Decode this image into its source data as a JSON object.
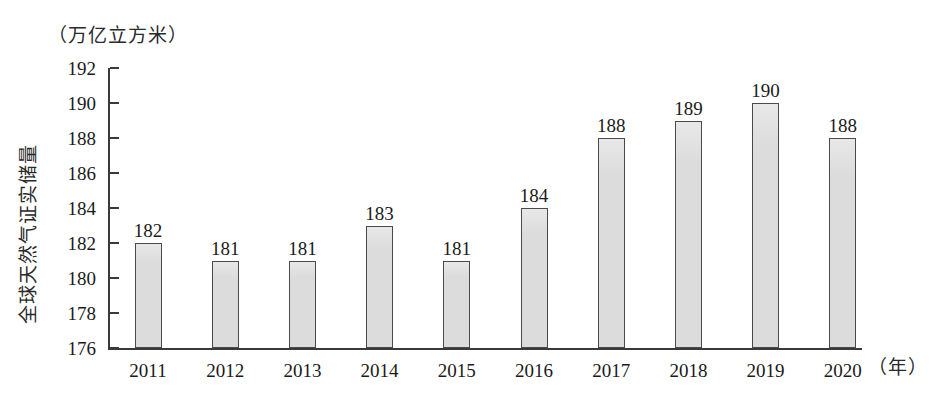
{
  "chart_data": {
    "type": "bar",
    "title": "",
    "subtitle": "",
    "xlabel": "（年）",
    "ylabel": "全球天然气证实储量",
    "unit_caption": "（万亿立方米）",
    "categories": [
      "2011",
      "2012",
      "2013",
      "2014",
      "2015",
      "2016",
      "2017",
      "2018",
      "2019",
      "2020"
    ],
    "values": [
      182,
      181,
      181,
      183,
      181,
      184,
      188,
      189,
      190,
      188
    ],
    "value_labels": [
      "182",
      "181",
      "181",
      "183",
      "181",
      "184",
      "188",
      "189",
      "190",
      "188"
    ],
    "ylim": [
      176,
      192
    ],
    "yticks": [
      176,
      178,
      180,
      182,
      184,
      186,
      188,
      190,
      192
    ],
    "ytick_labels": [
      "176",
      "178",
      "180",
      "182",
      "184",
      "186",
      "188",
      "190",
      "192"
    ],
    "grid": false,
    "legend": null,
    "series": [
      {
        "name": "全球天然气证实储量",
        "values": [
          182,
          181,
          181,
          183,
          181,
          184,
          188,
          189,
          190,
          188
        ]
      }
    ],
    "colors": {
      "bar_fill": "#dcdcdc",
      "bar_border": "#4a4a4a",
      "axis": "#3a3a3a",
      "text": "#1a1a1a",
      "background": "#ffffff"
    }
  }
}
